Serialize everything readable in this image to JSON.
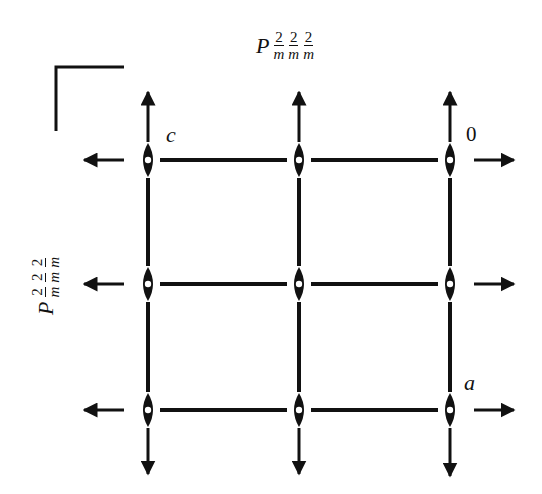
{
  "diagram": {
    "type": "space-group-symmetry-diagram",
    "top_symbol": {
      "prefix": "P",
      "fractions": [
        {
          "num": "2",
          "den": "m"
        },
        {
          "num": "2",
          "den": "m"
        },
        {
          "num": "2",
          "den": "m"
        }
      ]
    },
    "left_symbol": {
      "prefix": "P",
      "fractions": [
        {
          "num": "2",
          "den": "m"
        },
        {
          "num": "2",
          "den": "m"
        },
        {
          "num": "2",
          "den": "m"
        }
      ]
    },
    "axis_labels": {
      "origin": "0",
      "a": "a",
      "c": "c"
    },
    "grid": {
      "columns_x": [
        148,
        299,
        450
      ],
      "rows_y": [
        160,
        284,
        410
      ]
    },
    "colors": {
      "ink": "#111111",
      "background": "#ffffff"
    }
  }
}
